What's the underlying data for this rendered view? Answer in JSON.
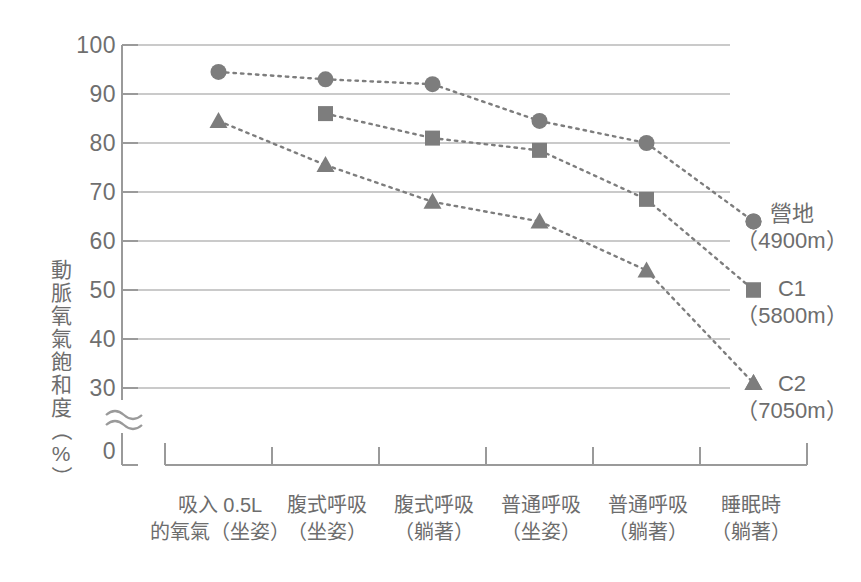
{
  "chart_data": {
    "type": "line",
    "title": "",
    "xlabel": "",
    "ylabel": "動脈氧氣飽和度（%）",
    "ylim": [
      30,
      100
    ],
    "yticks": [
      100,
      90,
      80,
      70,
      60,
      50,
      40,
      30,
      0
    ],
    "axis_break": "≈",
    "grid": true,
    "legend_position": "right",
    "categories": [
      "吸入 0.5L 的氧氣（坐姿）",
      "腹式呼吸（坐姿）",
      "腹式呼吸（躺著）",
      "普通呼吸（坐姿）",
      "普通呼吸（躺著）",
      "睡眠時（躺著）"
    ],
    "series": [
      {
        "name": "營地",
        "altitude": "（4900m）",
        "marker": "circle",
        "color": "#7d7d7d",
        "values": [
          94.5,
          93.0,
          92.0,
          84.5,
          80.0,
          64.0
        ]
      },
      {
        "name": "C1",
        "altitude": "（5800m）",
        "marker": "square",
        "color": "#7d7d7d",
        "values": [
          null,
          86.0,
          81.0,
          78.5,
          68.5,
          50.0
        ]
      },
      {
        "name": "C2",
        "altitude": "（7050m）",
        "marker": "triangle",
        "color": "#7d7d7d",
        "values": [
          84.5,
          75.5,
          68.0,
          64.0,
          54.0,
          31.0
        ]
      }
    ]
  },
  "axis": {
    "y_ticks": {
      "t100": "100",
      "t90": "90",
      "t80": "80",
      "t70": "70",
      "t60": "60",
      "t50": "50",
      "t40": "40",
      "t30": "30",
      "t0": "0"
    },
    "y_title_chars": {
      "c1": "動",
      "c2": "脈",
      "c3": "氧",
      "c4": "氣",
      "c5": "飽",
      "c6": "和",
      "c7": "度",
      "open_paren": "（",
      "percent": "%",
      "close_paren": "）"
    }
  },
  "x_labels": [
    {
      "line1": "吸入 0.5L",
      "line2": "的氧氣（坐姿）"
    },
    {
      "line1": "腹式呼吸",
      "line2": "（坐姿）"
    },
    {
      "line1": "腹式呼吸",
      "line2": "（躺著）"
    },
    {
      "line1": "普通呼吸",
      "line2": "（坐姿）"
    },
    {
      "line1": "普通呼吸",
      "line2": "（躺著）"
    },
    {
      "line1": "睡眠時",
      "line2": "（躺著）"
    }
  ],
  "legend": [
    {
      "name": "營地",
      "alt": "（4900m）"
    },
    {
      "name": "C1",
      "alt": "（5800m）"
    },
    {
      "name": "C2",
      "alt": "（7050m）"
    }
  ],
  "colors": {
    "marker": "#7d7d7d",
    "gridline": "#b9b9b9",
    "axis": "#9a9a9a",
    "text": "#6d6d6d"
  }
}
